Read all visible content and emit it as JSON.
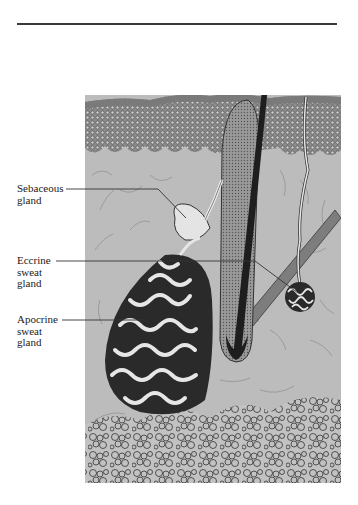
{
  "figure": {
    "labels": [
      {
        "id": "sebaceous",
        "lines": [
          "Sebaceous",
          "gland"
        ]
      },
      {
        "id": "eccrine",
        "lines": [
          "Eccrine",
          "sweat",
          "gland"
        ]
      },
      {
        "id": "apocrine",
        "lines": [
          "Apocrine",
          "sweat",
          "gland"
        ]
      }
    ],
    "colors": {
      "dermis": "#b9b9b9",
      "epidermis": "#6e6e6e",
      "hair": "#1e1e1e",
      "line": "#333333",
      "fat": "#c4c4c4"
    }
  }
}
